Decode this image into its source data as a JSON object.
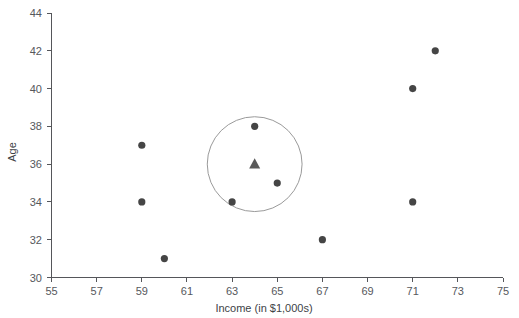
{
  "chart_data": {
    "type": "scatter",
    "title": "",
    "xlabel": "Income (in $1,000s)",
    "ylabel": "Age",
    "xlim": [
      55,
      75
    ],
    "ylim": [
      30,
      44
    ],
    "xticks": [
      55,
      57,
      59,
      61,
      63,
      65,
      67,
      69,
      71,
      73,
      75
    ],
    "yticks": [
      30,
      32,
      34,
      36,
      38,
      40,
      42,
      44
    ],
    "grid": false,
    "legend": "none",
    "series": [
      {
        "name": "Observations",
        "marker": "circle",
        "color": "#454545",
        "points": [
          {
            "x": 59,
            "y": 37
          },
          {
            "x": 59,
            "y": 34
          },
          {
            "x": 60,
            "y": 31
          },
          {
            "x": 63,
            "y": 34
          },
          {
            "x": 64,
            "y": 38
          },
          {
            "x": 65,
            "y": 35
          },
          {
            "x": 67,
            "y": 32
          },
          {
            "x": 71,
            "y": 34
          },
          {
            "x": 71,
            "y": 40
          },
          {
            "x": 72,
            "y": 42
          }
        ]
      },
      {
        "name": "Cluster centroid",
        "marker": "triangle",
        "color": "#5a5a5a",
        "points": [
          {
            "x": 64,
            "y": 36
          }
        ]
      }
    ],
    "annotations": [
      {
        "type": "circle",
        "name": "cluster-boundary",
        "cx": 64,
        "cy": 36,
        "radius_x_units": 2.1,
        "stroke": "#9a9a9a"
      }
    ]
  },
  "colors": {
    "point": "#454545",
    "centroid": "#5a5a5a",
    "ring": "#9a9a9a",
    "axis": "#55565a",
    "tick_label": "#56585c",
    "background": "#ffffff"
  },
  "axes": {
    "x_tick_labels": [
      "55",
      "57",
      "59",
      "61",
      "63",
      "65",
      "67",
      "69",
      "71",
      "73",
      "75"
    ],
    "y_tick_labels": [
      "30",
      "32",
      "34",
      "36",
      "38",
      "40",
      "42",
      "44"
    ],
    "x_title": "Income (in $1,000s)",
    "y_title": "Age"
  }
}
